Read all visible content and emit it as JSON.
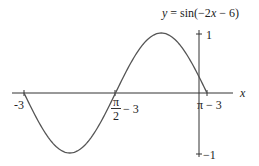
{
  "chart_data": {
    "type": "line",
    "title": "y = sin(−2x − 6)",
    "xlabel": "x",
    "ylabel": "",
    "x_ticks": [
      "-3",
      "π/2 − 3",
      "π − 3"
    ],
    "y_ticks": [
      "1",
      "-1"
    ],
    "xlim": [
      -3,
      0.1416
    ],
    "ylim": [
      -1,
      1
    ],
    "series": [
      {
        "name": "y = sin(-2x - 6)",
        "x": [
          -3,
          -2.2146,
          -1.4292,
          -0.6438,
          0.1416
        ],
        "y": [
          0,
          -1,
          0,
          1,
          0
        ]
      }
    ],
    "grid": false
  },
  "labels": {
    "title_prefix": "y = sin(−2",
    "title_x": "x",
    "title_suffix": " − 6)",
    "x_axis": "x",
    "tick_neg3": "-3",
    "tick_pi_num": "π",
    "tick_pi_den": "2",
    "tick_pi_half_suffix": "− 3",
    "tick_pi_minus3": "π − 3",
    "tick_y1": "1",
    "tick_ym1": "−1"
  }
}
